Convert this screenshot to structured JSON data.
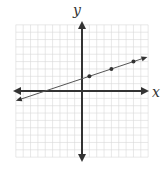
{
  "chart_data": {
    "type": "line",
    "title": "",
    "xlabel": "x",
    "ylabel": "y",
    "xlim": [
      -9,
      9
    ],
    "ylim": [
      -9,
      9
    ],
    "grid": true,
    "grid_step": 1,
    "legend": null,
    "series": [
      {
        "name": "line",
        "equation": "y = (1/3)x + 5/3",
        "slope": 0.3333,
        "intercept": 1.6667,
        "x_range": [
          -9,
          8.9
        ],
        "arrows_both_ends": true,
        "points": [
          {
            "x": 1,
            "y": 2
          },
          {
            "x": 4,
            "y": 3
          },
          {
            "x": 7,
            "y": 4
          }
        ]
      }
    ]
  },
  "labels": {
    "x_axis": "x",
    "y_axis": "y"
  },
  "colors": {
    "grid": "#d9d9d9",
    "axis": "#333333",
    "line": "#555555",
    "point": "#333333"
  }
}
